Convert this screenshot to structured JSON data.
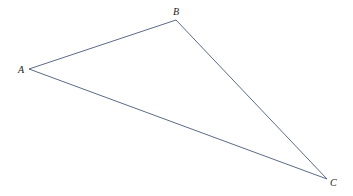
{
  "diagram": {
    "type": "triangle",
    "vertices": [
      {
        "label": "A",
        "x": 29,
        "y": 69,
        "label_x": 18,
        "label_y": 73
      },
      {
        "label": "B",
        "x": 176,
        "y": 20,
        "label_x": 173,
        "label_y": 15
      },
      {
        "label": "C",
        "x": 327,
        "y": 179,
        "label_x": 330,
        "label_y": 186
      }
    ],
    "edges": [
      [
        "A",
        "B"
      ],
      [
        "B",
        "C"
      ],
      [
        "C",
        "A"
      ]
    ],
    "edge_color": "#4a5a78",
    "background": "#ffffff"
  }
}
